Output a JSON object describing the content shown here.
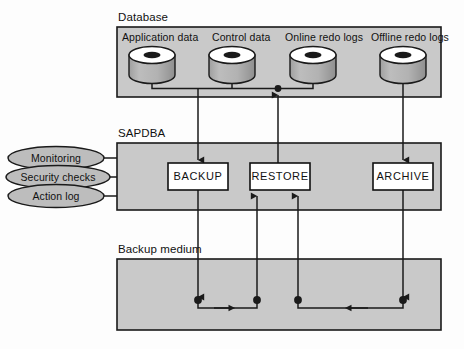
{
  "diagram": {
    "type": "block-flow",
    "title_groups": {
      "database": "Database",
      "sapdba": "SAPDBA",
      "backup_medium": "Backup medium"
    },
    "colors": {
      "panel_fill": "#c9c9c9",
      "panel_stroke": "#1a1a1a",
      "cylinder_body": "#b0b0b0",
      "cylinder_top": "#ffffff",
      "cylinder_hole": "#1a1a1a",
      "box_fill": "#ffffff",
      "box_stroke": "#111111",
      "line": "#1a1a1a",
      "ellipse_fill": "#bdbdbd",
      "page_bg": "#ffffff",
      "text": "#111111"
    },
    "database_panel": {
      "label": "Database",
      "stores": [
        {
          "name": "Application data",
          "shape": "cylinder"
        },
        {
          "name": "Control data",
          "shape": "cylinder"
        },
        {
          "name": "Online redo logs",
          "shape": "cylinder"
        },
        {
          "name": "Offline redo logs",
          "shape": "cylinder"
        }
      ]
    },
    "sapdba_panel": {
      "label": "SAPDBA",
      "functions": [
        {
          "name": "BACKUP"
        },
        {
          "name": "RESTORE"
        },
        {
          "name": "ARCHIVE"
        }
      ],
      "side_features": [
        {
          "name": "Monitoring"
        },
        {
          "name": "Security checks"
        },
        {
          "name": "Action log"
        }
      ]
    },
    "backup_medium_panel": {
      "label": "Backup medium",
      "junction_count": 4
    },
    "flows": [
      {
        "from": "Application data / Control data / Online redo logs",
        "to": "BACKUP",
        "direction": "down"
      },
      {
        "from": "BACKUP",
        "to": "Backup medium",
        "direction": "down"
      },
      {
        "from": "Backup medium",
        "to": "RESTORE",
        "direction": "up"
      },
      {
        "from": "RESTORE",
        "to": "Online redo logs",
        "direction": "up"
      },
      {
        "from": "Offline redo logs",
        "to": "ARCHIVE",
        "direction": "down"
      },
      {
        "from": "ARCHIVE",
        "to": "Backup medium",
        "direction": "down"
      },
      {
        "from": "Backup medium",
        "to": "RESTORE (second path)",
        "direction": "up"
      }
    ]
  }
}
